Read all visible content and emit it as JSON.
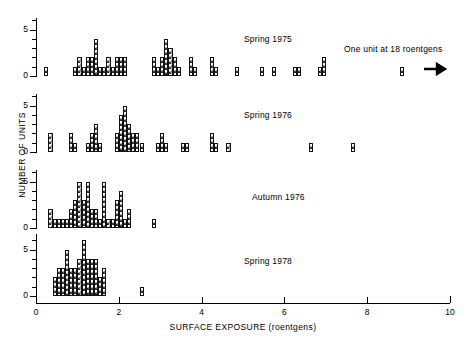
{
  "chart_data": {
    "type": "bar",
    "title": "",
    "xlabel": "SURFACE EXPOSURE (roentgens)",
    "ylabel": "NUMBER OF UNITS",
    "xlim": [
      0,
      10
    ],
    "ylim": [
      0,
      6
    ],
    "xticks": [
      0,
      2,
      4,
      6,
      8,
      10
    ],
    "xtick_labels": [
      "0",
      "2",
      "4",
      "6",
      "8",
      "10"
    ],
    "yticks": [
      0,
      1,
      2,
      3,
      4,
      5,
      6
    ],
    "ytick_labels": {
      "0": "0",
      "5": "5"
    },
    "grid": false,
    "bin_width": 0.1,
    "annotation": {
      "text": "One unit at 18 roentgens",
      "marker_x": 8.8,
      "marker_value": 1,
      "arrow": "right-arrow"
    },
    "panels": [
      {
        "label": "Spring 1975",
        "bins": [
          {
            "x": 0.2,
            "v": 1
          },
          {
            "x": 0.9,
            "v": 1
          },
          {
            "x": 1.0,
            "v": 2
          },
          {
            "x": 1.1,
            "v": 1
          },
          {
            "x": 1.2,
            "v": 2
          },
          {
            "x": 1.3,
            "v": 2
          },
          {
            "x": 1.4,
            "v": 4
          },
          {
            "x": 1.5,
            "v": 1
          },
          {
            "x": 1.6,
            "v": 1
          },
          {
            "x": 1.7,
            "v": 2
          },
          {
            "x": 1.8,
            "v": 1
          },
          {
            "x": 1.9,
            "v": 2
          },
          {
            "x": 2.0,
            "v": 2
          },
          {
            "x": 2.1,
            "v": 2
          },
          {
            "x": 2.8,
            "v": 2
          },
          {
            "x": 2.9,
            "v": 1
          },
          {
            "x": 3.0,
            "v": 2
          },
          {
            "x": 3.1,
            "v": 4
          },
          {
            "x": 3.2,
            "v": 3
          },
          {
            "x": 3.3,
            "v": 2
          },
          {
            "x": 3.4,
            "v": 1
          },
          {
            "x": 3.7,
            "v": 2
          },
          {
            "x": 3.8,
            "v": 1
          },
          {
            "x": 4.2,
            "v": 2
          },
          {
            "x": 4.3,
            "v": 1
          },
          {
            "x": 4.8,
            "v": 1
          },
          {
            "x": 5.4,
            "v": 1
          },
          {
            "x": 5.7,
            "v": 1
          },
          {
            "x": 6.2,
            "v": 1
          },
          {
            "x": 6.3,
            "v": 1
          },
          {
            "x": 6.8,
            "v": 1
          },
          {
            "x": 6.9,
            "v": 2
          }
        ]
      },
      {
        "label": "Spring 1976",
        "bins": [
          {
            "x": 0.3,
            "v": 2
          },
          {
            "x": 0.8,
            "v": 2
          },
          {
            "x": 0.9,
            "v": 1
          },
          {
            "x": 1.2,
            "v": 1
          },
          {
            "x": 1.3,
            "v": 2
          },
          {
            "x": 1.4,
            "v": 3
          },
          {
            "x": 1.5,
            "v": 1
          },
          {
            "x": 1.9,
            "v": 2
          },
          {
            "x": 2.0,
            "v": 4
          },
          {
            "x": 2.1,
            "v": 5
          },
          {
            "x": 2.2,
            "v": 3
          },
          {
            "x": 2.3,
            "v": 2
          },
          {
            "x": 2.4,
            "v": 2
          },
          {
            "x": 2.5,
            "v": 1
          },
          {
            "x": 2.9,
            "v": 1
          },
          {
            "x": 3.0,
            "v": 2
          },
          {
            "x": 3.1,
            "v": 1
          },
          {
            "x": 3.5,
            "v": 1
          },
          {
            "x": 3.6,
            "v": 1
          },
          {
            "x": 4.2,
            "v": 2
          },
          {
            "x": 4.3,
            "v": 1
          },
          {
            "x": 4.6,
            "v": 1
          },
          {
            "x": 6.6,
            "v": 1
          },
          {
            "x": 7.6,
            "v": 1
          }
        ]
      },
      {
        "label": "Autumn 1976",
        "bins": [
          {
            "x": 0.3,
            "v": 2
          },
          {
            "x": 0.4,
            "v": 1
          },
          {
            "x": 0.5,
            "v": 1
          },
          {
            "x": 0.6,
            "v": 1
          },
          {
            "x": 0.7,
            "v": 1
          },
          {
            "x": 0.8,
            "v": 2
          },
          {
            "x": 0.9,
            "v": 3
          },
          {
            "x": 1.0,
            "v": 5
          },
          {
            "x": 1.1,
            "v": 3
          },
          {
            "x": 1.2,
            "v": 5
          },
          {
            "x": 1.3,
            "v": 2
          },
          {
            "x": 1.4,
            "v": 2
          },
          {
            "x": 1.5,
            "v": 1
          },
          {
            "x": 1.6,
            "v": 5
          },
          {
            "x": 1.7,
            "v": 1
          },
          {
            "x": 1.8,
            "v": 1
          },
          {
            "x": 1.9,
            "v": 3
          },
          {
            "x": 2.0,
            "v": 4
          },
          {
            "x": 2.1,
            "v": 1
          },
          {
            "x": 2.2,
            "v": 2
          },
          {
            "x": 2.8,
            "v": 1
          }
        ]
      },
      {
        "label": "Spring 1978",
        "bins": [
          {
            "x": 0.4,
            "v": 2
          },
          {
            "x": 0.5,
            "v": 3
          },
          {
            "x": 0.6,
            "v": 3
          },
          {
            "x": 0.7,
            "v": 5
          },
          {
            "x": 0.8,
            "v": 3
          },
          {
            "x": 0.9,
            "v": 3
          },
          {
            "x": 1.0,
            "v": 4
          },
          {
            "x": 1.1,
            "v": 6
          },
          {
            "x": 1.2,
            "v": 4
          },
          {
            "x": 1.3,
            "v": 4
          },
          {
            "x": 1.4,
            "v": 4
          },
          {
            "x": 1.5,
            "v": 2
          },
          {
            "x": 1.6,
            "v": 3
          },
          {
            "x": 2.5,
            "v": 1
          }
        ]
      }
    ]
  }
}
